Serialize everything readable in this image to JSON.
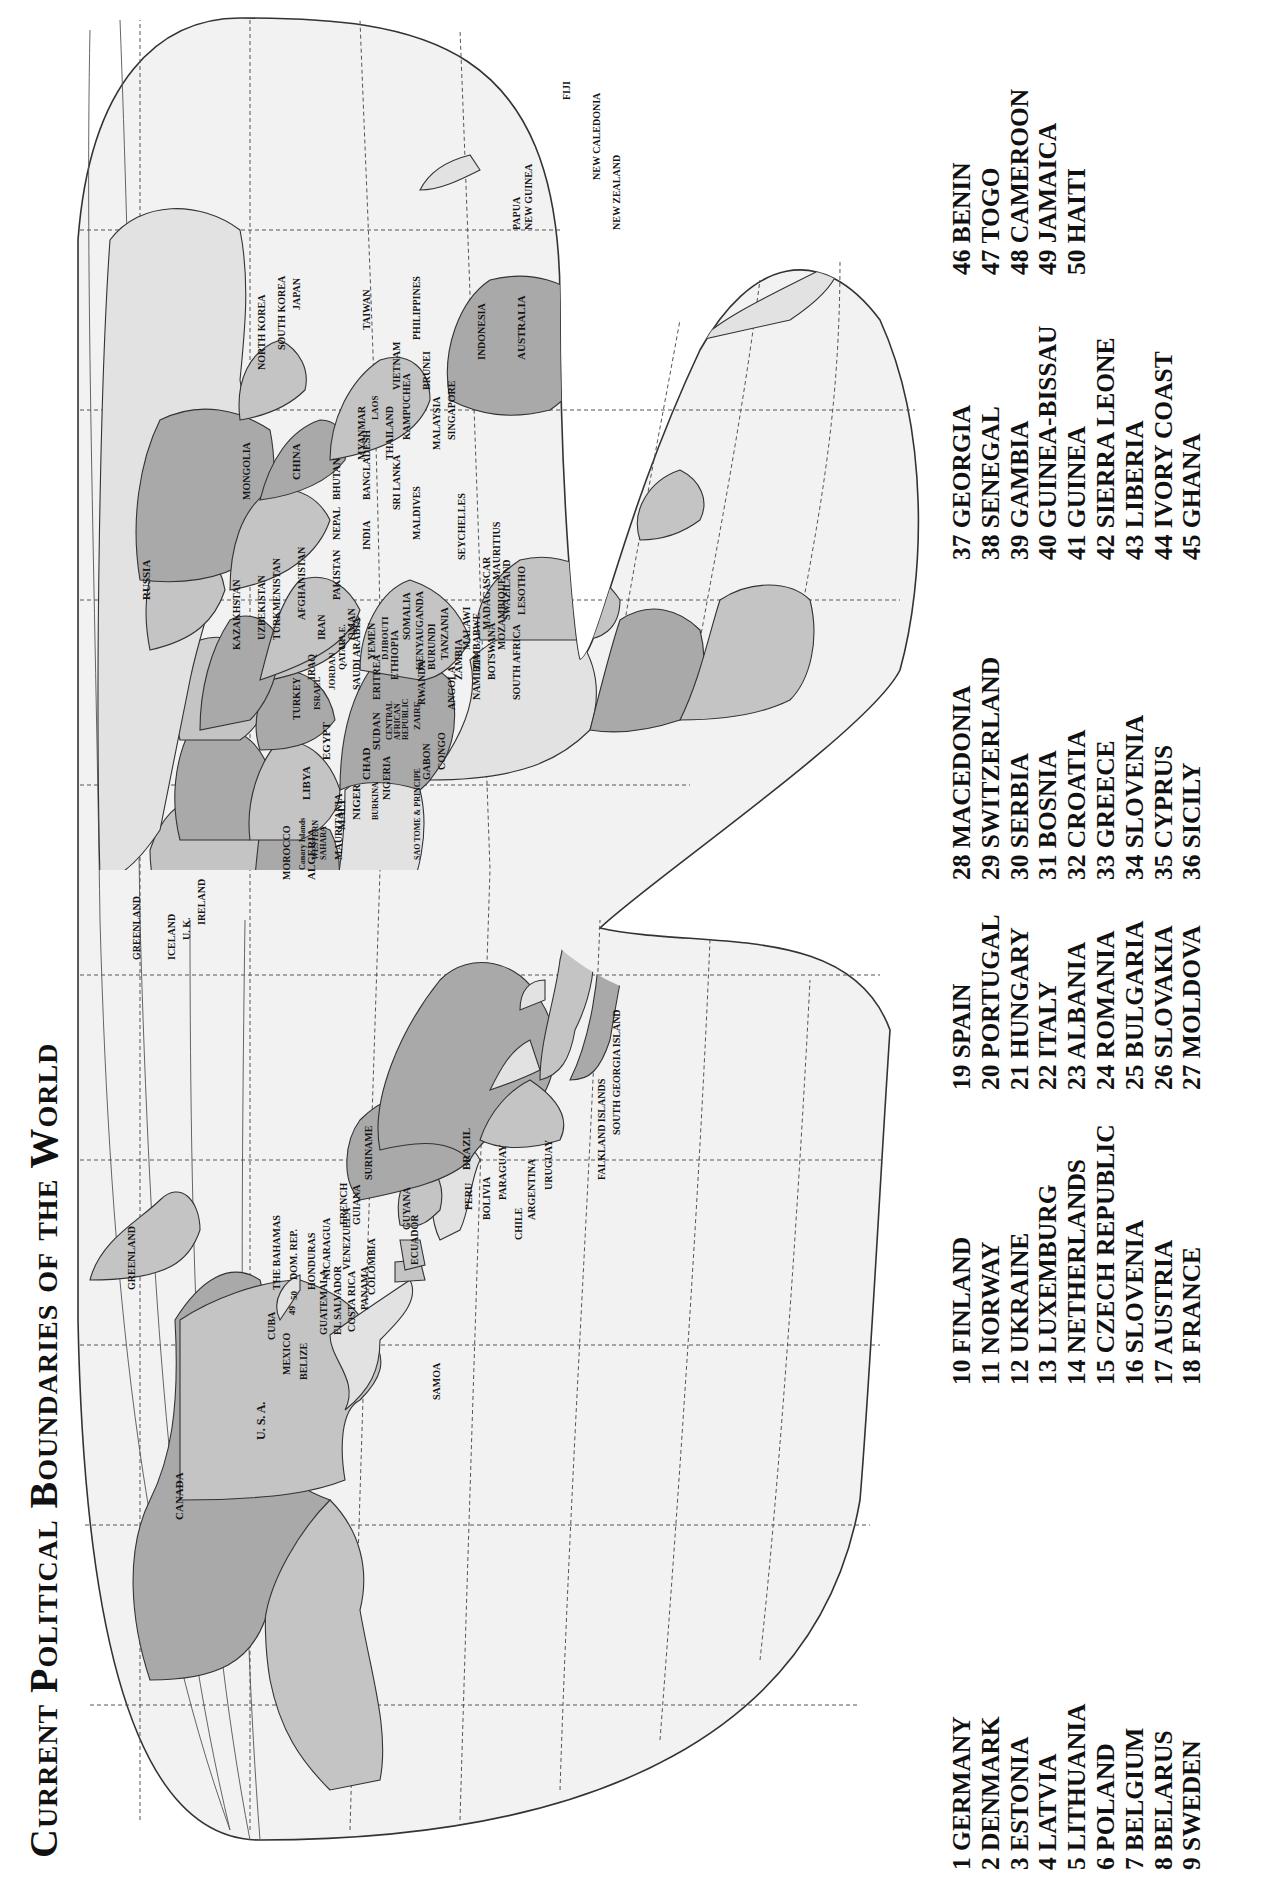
{
  "title": "Current Political Boundaries of the World",
  "colors": {
    "ocean": "#f2f2f2",
    "land_dark": "#a9a9a9",
    "land_mid": "#c4c4c4",
    "land_light": "#e2e2e2",
    "grid": "#555555",
    "outline": "#333333",
    "text": "#111111"
  },
  "map": {
    "labels": {
      "canada": "CANADA",
      "usa": "U. S. A.",
      "greenland_w": "GREENLAND",
      "mexico": "MEXICO",
      "belize": "BELIZE",
      "guatemala": "GUATEMALA",
      "el_salvador": "EL SALVADOR",
      "costa_rica": "COSTA RICA",
      "panama": "PANAMA",
      "honduras": "HONDURAS",
      "nicaragua": "NICARAGUA",
      "cuba": "CUBA",
      "bahamas": "THE BAHAMAS",
      "dom_rep": "DOM. REP.",
      "n49": "49",
      "n50": "50",
      "colombia": "COLOMBIA",
      "venezuela": "VENEZUELA",
      "ecuador": "ECUADOR",
      "french_guiana_1": "FRENCH",
      "french_guiana_2": "GUIANA",
      "suriname": "SURINAME",
      "guyana": "GUYANA",
      "brazil": "BRAZIL",
      "peru": "PERU",
      "bolivia": "BOLIVIA",
      "paraguay": "PARAGUAY",
      "chile": "CHILE",
      "argentina": "ARGENTINA",
      "uruguay": "URUGUAY",
      "falkland": "FALKLAND ISLANDS",
      "south_georgia": "SOUTH GEORGIA ISLAND",
      "samoa": "SAMOA",
      "greenland_e": "GREENLAND",
      "iceland": "ICELAND",
      "uk": "U. K.",
      "ireland": "IRELAND",
      "morocco": "MOROCCO",
      "canary": "Canary Islands",
      "western_sahara_1": "WESTERN",
      "western_sahara_2": "SAHARA",
      "mauritania": "MAURITANIA",
      "algeria": "ALGERIA",
      "mali": "MALI",
      "niger": "NIGER",
      "libya": "LIBYA",
      "egypt": "EGYPT",
      "chad": "CHAD",
      "sudan": "SUDAN",
      "nigeria": "NIGERIA",
      "burkina": "BURKINA",
      "car_1": "CENTRAL",
      "car_2": "AFRICAN",
      "car_3": "REPUBLIC",
      "zaire": "ZAIRE",
      "sao_tome": "SAO TOME & PRINCIPE",
      "gabon": "GABON",
      "congo": "CONGO",
      "angola": "ANGOLA",
      "zambia": "ZAMBIA",
      "namibia": "NAMIBIA",
      "botswana": "BOTSWANA",
      "zimbabwe": "ZIMBABWE",
      "mozambique": "MOZAMBIQUE",
      "south_africa": "SOUTH AFRICA",
      "swaziland": "SWAZILAND",
      "lesotho": "LESOTHO",
      "madagascar": "MADAGASCAR",
      "mauritius": "MAURITIUS",
      "malawi": "MALAWI",
      "tanzania": "TANZANIA",
      "burundi": "BURUNDI",
      "rwanda": "RWANDA",
      "kenya": "KENYA",
      "uganda": "UGANDA",
      "somalia": "SOMALIA",
      "ethiopia": "ETHIOPIA",
      "eritrea": "ERITREA",
      "djibouti": "DJIBOUTI",
      "yemen": "YEMEN",
      "saudi": "SAUDI ARABIA",
      "oman": "OMAN",
      "uae": "U.A.E.",
      "qatar": "QATAR",
      "jordan": "JORDAN",
      "israel": "ISRAEL",
      "iraq": "IRAQ",
      "iran": "IRAN",
      "turkey": "TURKEY",
      "seychelles": "SEYCHELLES",
      "maldives": "MALDIVES",
      "russia": "RUSSIA",
      "kazakhstan": "KAZAKHSTAN",
      "uzbekistan": "UZBEKISTAN",
      "turkmenistan": "TURKMENISTAN",
      "afghanistan": "AFGHANISTAN",
      "pakistan": "PAKISTAN",
      "india": "INDIA",
      "nepal": "NEPAL",
      "bhutan": "BHUTAN",
      "bangladesh": "BANGLADESH",
      "sri_lanka": "SRI LANKA",
      "mongolia": "MONGOLIA",
      "china": "CHINA",
      "myanmar": "MYANMAR",
      "laos": "LAOS",
      "thailand": "THAILAND",
      "kampuchea": "KAMPUCHEA",
      "vietnam": "VIETNAM",
      "malaysia": "MALAYSIA",
      "singapore": "SINGAPORE",
      "brunei": "BRUNEI",
      "indonesia": "INDONESIA",
      "philippines": "PHILIPPINES",
      "taiwan": "TAIWAN",
      "north_korea": "NORTH KOREA",
      "south_korea": "SOUTH KOREA",
      "japan": "JAPAN",
      "png_1": "PAPUA",
      "png_2": "NEW GUINEA",
      "australia": "AUSTRALIA",
      "new_zealand": "NEW ZEALAND",
      "new_caledonia": "NEW CALEDONIA",
      "fiji": "FIJI",
      "europe_numbers": [
        "1",
        "2",
        "3",
        "4",
        "5",
        "6",
        "7",
        "8",
        "9",
        "10",
        "11",
        "12",
        "13",
        "14",
        "15",
        "16",
        "17",
        "18",
        "20",
        "21",
        "22",
        "23",
        "24",
        "25",
        "26",
        "27",
        "28",
        "29",
        "30",
        "31",
        "32",
        "33",
        "34",
        "35",
        "36"
      ],
      "west_africa_numbers": [
        "38",
        "39",
        "40",
        "41",
        "42",
        "43",
        "44",
        "45",
        "46",
        "47",
        "48"
      ]
    }
  },
  "legend": {
    "columns": [
      [
        "1 GERMANY",
        "2 DENMARK",
        "3 ESTONIA",
        "4 LATVIA",
        "5 LITHUANIA",
        "6 POLAND",
        "7 BELGIUM",
        "8 BELARUS",
        "9 SWEDEN"
      ],
      [
        "10 FINLAND",
        "11 NORWAY",
        "12 UKRAINE",
        "13 LUXEMBURG",
        "14 NETHERLANDS",
        "15 CZECH REPUBLIC",
        "16 SLOVENIA",
        "17 AUSTRIA",
        "18 FRANCE"
      ],
      [
        "19 SPAIN",
        "20 PORTUGAL",
        "21 HUNGARY",
        "22 ITALY",
        "23 ALBANIA",
        "24 ROMANIA",
        "25 BULGARIA",
        "26 SLOVAKIA",
        "27 MOLDOVA"
      ],
      [
        "28 MACEDONIA",
        "29 SWITZERLAND",
        "30 SERBIA",
        "31 BOSNIA",
        "32 CROATIA",
        "33 GREECE",
        "34 SLOVENIA",
        "35 CYPRUS",
        "36 SICILY"
      ],
      [
        "37 GEORGIA",
        "38 SENEGAL",
        "39 GAMBIA",
        "40 GUINEA-BISSAU",
        "41 GUINEA",
        "42 SIERRA LEONE",
        "43 LIBERIA",
        "44 IVORY COAST",
        "45 GHANA"
      ],
      [
        "46 BENIN",
        "47 TOGO",
        "48 CAMEROON",
        "49 JAMAICA",
        "50 HAITI"
      ]
    ]
  }
}
